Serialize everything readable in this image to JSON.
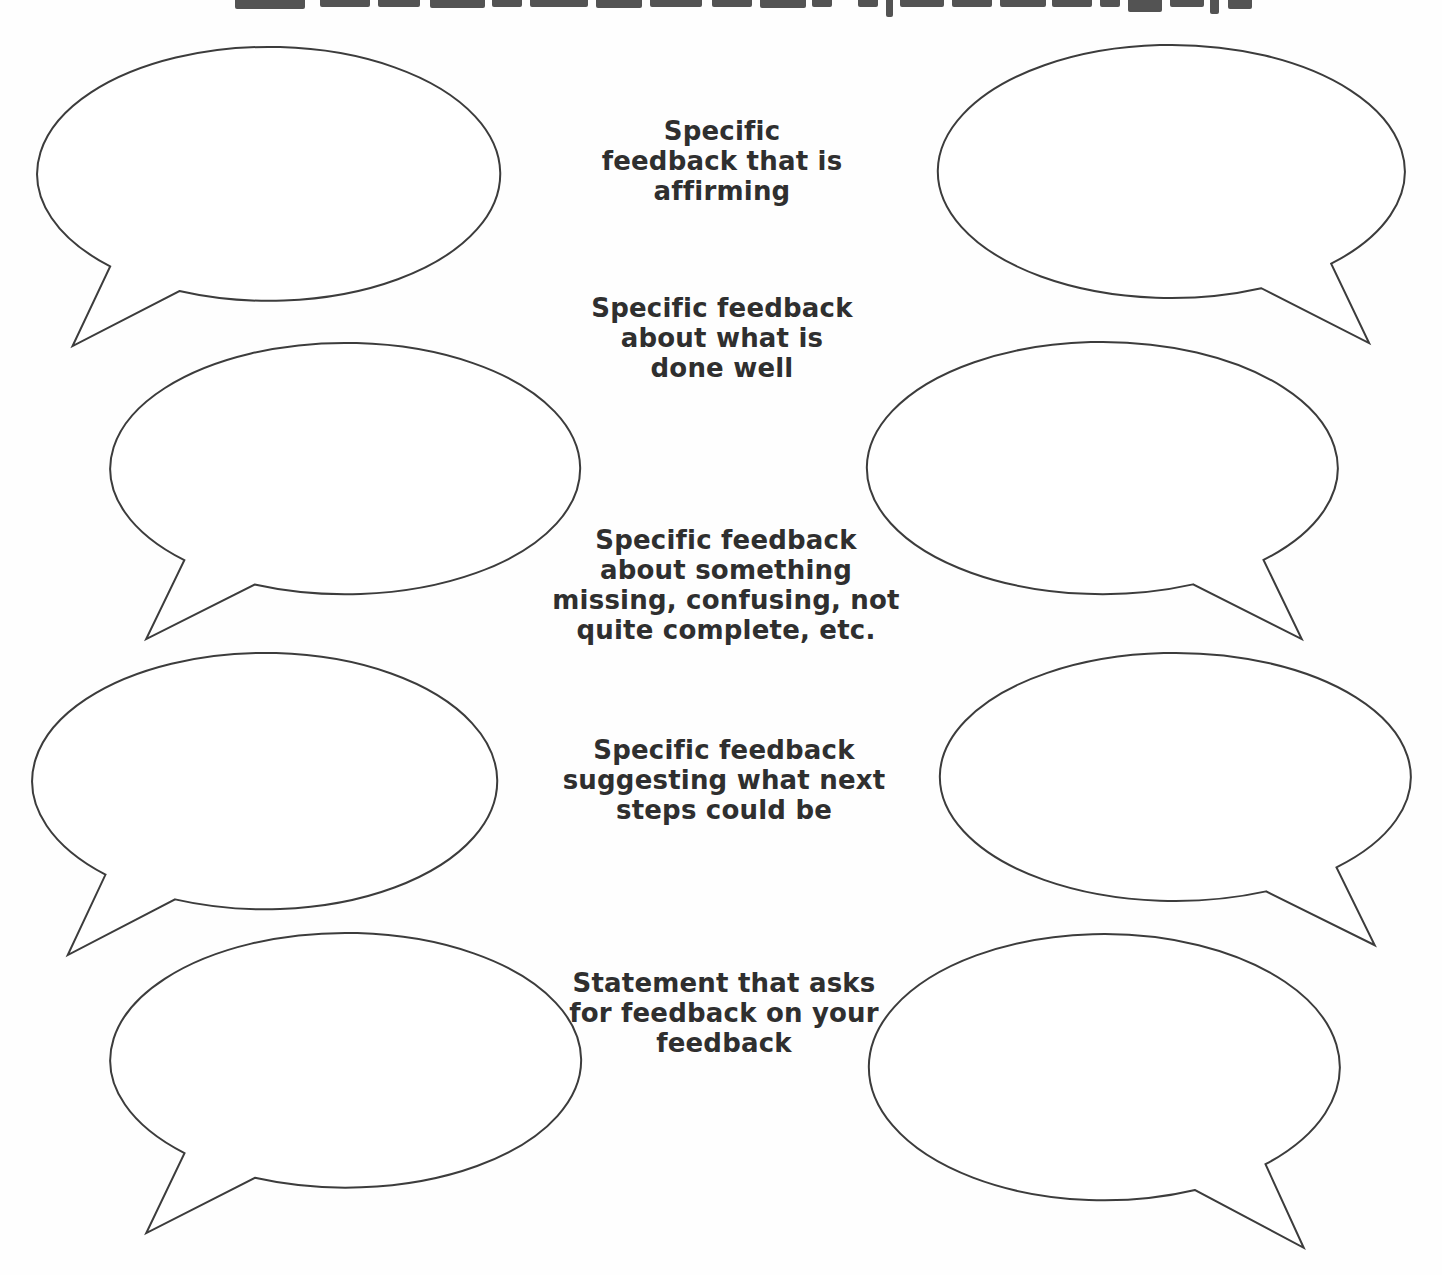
{
  "page": {
    "width": 1442,
    "height": 1275,
    "background_color": "#fefefe",
    "line_color": "#3c3c3c",
    "text_color": "#2f2f2f"
  },
  "cropped_title": {
    "fragments": [
      {
        "left": 235,
        "width": 70,
        "height": 9
      },
      {
        "left": 320,
        "width": 50,
        "height": 7
      },
      {
        "left": 378,
        "width": 42,
        "height": 7
      },
      {
        "left": 430,
        "width": 55,
        "height": 8
      },
      {
        "left": 492,
        "width": 30,
        "height": 7
      },
      {
        "left": 530,
        "width": 58,
        "height": 7
      },
      {
        "left": 596,
        "width": 46,
        "height": 8
      },
      {
        "left": 650,
        "width": 52,
        "height": 7
      },
      {
        "left": 712,
        "width": 40,
        "height": 7
      },
      {
        "left": 760,
        "width": 46,
        "height": 8
      },
      {
        "left": 812,
        "width": 20,
        "height": 7
      },
      {
        "left": 858,
        "width": 20,
        "height": 7
      },
      {
        "left": 886,
        "width": 7,
        "height": 17
      },
      {
        "left": 900,
        "width": 44,
        "height": 7
      },
      {
        "left": 952,
        "width": 40,
        "height": 7
      },
      {
        "left": 1000,
        "width": 46,
        "height": 7
      },
      {
        "left": 1052,
        "width": 40,
        "height": 7
      },
      {
        "left": 1100,
        "width": 20,
        "height": 7
      },
      {
        "left": 1128,
        "width": 34,
        "height": 12
      },
      {
        "left": 1170,
        "width": 34,
        "height": 7
      },
      {
        "left": 1210,
        "width": 9,
        "height": 14
      },
      {
        "left": 1228,
        "width": 24,
        "height": 9
      }
    ]
  },
  "labels": [
    {
      "id": "affirming",
      "text": "Specific\nfeedback that is\naffirming",
      "top": 116,
      "center_x": 722
    },
    {
      "id": "done-well",
      "text": "Specific feedback\nabout what is\ndone well",
      "top": 293,
      "center_x": 722
    },
    {
      "id": "missing-confusing",
      "text": "Specific feedback\nabout something\nmissing, confusing, not\nquite complete, etc.",
      "top": 525,
      "center_x": 726
    },
    {
      "id": "next-steps",
      "text": "Specific feedback\nsuggesting what next\nsteps could be",
      "top": 735,
      "center_x": 724
    },
    {
      "id": "feedback-on-feedback",
      "text": "Statement that asks\nfor feedback on your\nfeedback",
      "top": 968,
      "center_x": 724
    }
  ],
  "bubbles": [
    {
      "row": 1,
      "side": "left",
      "tail": "bottom-left",
      "left": 31,
      "top": 45,
      "width": 475,
      "height": 307
    },
    {
      "row": 1,
      "side": "right",
      "tail": "bottom-right",
      "left": 932,
      "top": 43,
      "width": 479,
      "height": 306
    },
    {
      "row": 2,
      "side": "left",
      "tail": "bottom-left",
      "left": 104,
      "top": 341,
      "width": 482,
      "height": 304
    },
    {
      "row": 2,
      "side": "right",
      "tail": "bottom-right",
      "left": 861,
      "top": 340,
      "width": 483,
      "height": 305
    },
    {
      "row": 3,
      "side": "left",
      "tail": "bottom-left",
      "left": 26,
      "top": 651,
      "width": 477,
      "height": 310
    },
    {
      "row": 3,
      "side": "right",
      "tail": "bottom-right",
      "left": 934,
      "top": 651,
      "width": 483,
      "height": 300
    },
    {
      "row": 4,
      "side": "left",
      "tail": "bottom-left",
      "left": 104,
      "top": 931,
      "width": 483,
      "height": 308
    },
    {
      "row": 4,
      "side": "right",
      "tail": "bottom-right",
      "left": 863,
      "top": 932,
      "width": 483,
      "height": 322
    }
  ]
}
